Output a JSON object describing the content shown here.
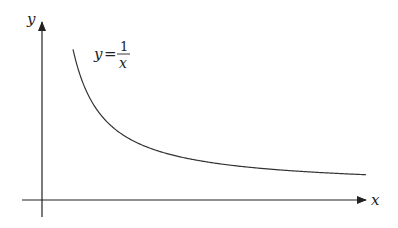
{
  "diagram": {
    "axes": {
      "x_label": "x",
      "y_label": "y"
    },
    "curve": {
      "equation_lhs": "y",
      "equals": "=",
      "numerator": "1",
      "denominator": "x",
      "function": "y = 1/x",
      "domain": "x > 0"
    },
    "colors": {
      "axis": "#222222",
      "curve": "#333333",
      "background": "#ffffff"
    }
  }
}
